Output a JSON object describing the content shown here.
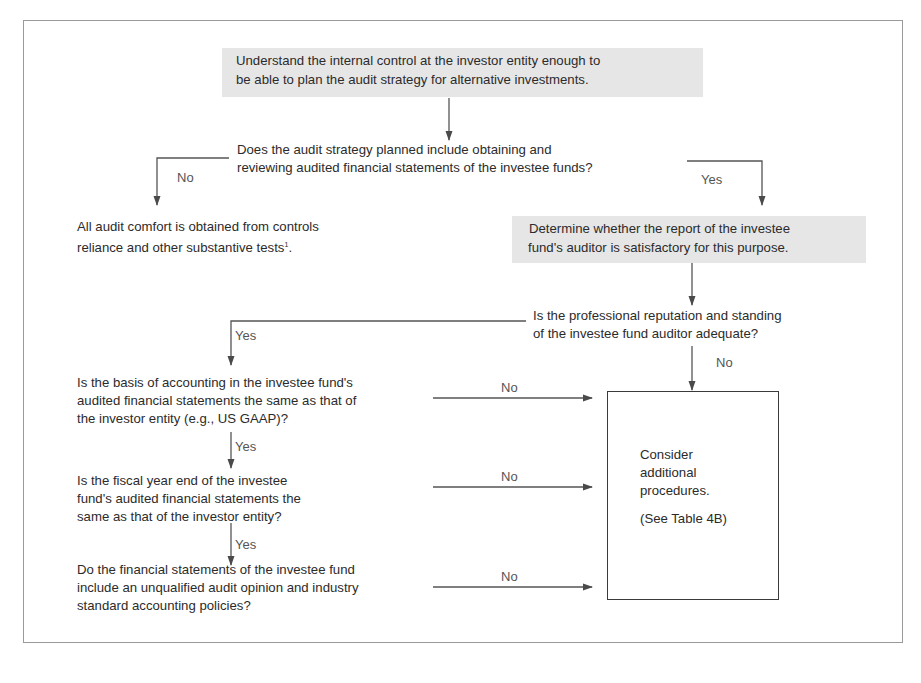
{
  "diagram": {
    "type": "flowchart",
    "start": {
      "line1": "Understand the internal control at the investor entity enough to",
      "line2": "be able to plan the audit strategy for alternative investments."
    },
    "question1": {
      "line1": "Does the audit strategy planned include obtaining and",
      "line2": "reviewing audited financial statements of the investee funds?",
      "no_label": "No",
      "yes_label": "Yes"
    },
    "no_outcome": {
      "line1": "All audit comfort is obtained from controls",
      "line2": "reliance and other substantive tests",
      "footnote_mark": "1",
      "end": "."
    },
    "determine": {
      "line1": "Determine whether the report of the investee",
      "line2": "fund's auditor is satisfactory for this purpose."
    },
    "question2": {
      "line1": "Is the professional reputation and standing",
      "line2": "of the investee fund auditor adequate?",
      "yes_label": "Yes",
      "no_label": "No"
    },
    "question3": {
      "line1": "Is the basis of accounting in the investee fund's",
      "line2": "audited financial statements the same as that of",
      "line3": "the investor entity (e.g., US GAAP)?",
      "no_label": "No",
      "yes_label": "Yes"
    },
    "question4": {
      "line1": "Is the fiscal year end of the investee",
      "line2": "fund's audited financial statements the",
      "line3": "same as that of the investor entity?",
      "no_label": "No",
      "yes_label": "Yes"
    },
    "question5": {
      "line1": "Do the financial statements of the investee fund",
      "line2": "include an unqualified audit opinion and industry",
      "line3": "standard accounting policies?",
      "no_label": "No"
    },
    "consider": {
      "line1": "Consider",
      "line2": "additional",
      "line3": "procedures.",
      "ref": "(See Table 4B)"
    }
  }
}
